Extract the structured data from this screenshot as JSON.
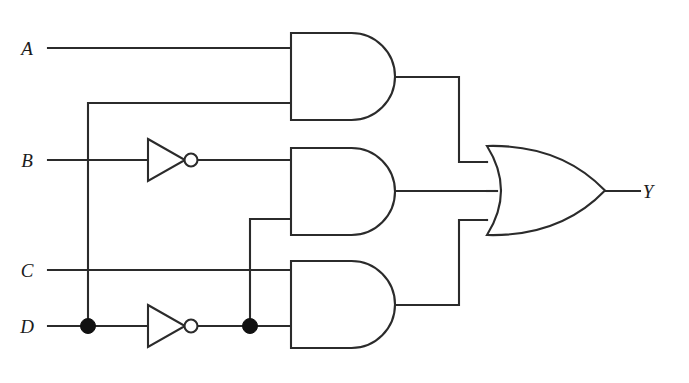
{
  "diagram": {
    "type": "logic-circuit-schematic",
    "background_color": "#ffffff",
    "line_color": "#2b2b2b",
    "junction_color": "#111111"
  },
  "inputs": [
    {
      "id": "A",
      "label": "A",
      "label_x": 27,
      "label_y": 55,
      "wire_y": 48
    },
    {
      "id": "B",
      "label": "B",
      "label_x": 27,
      "label_y": 167,
      "wire_y": 160
    },
    {
      "id": "C",
      "label": "C",
      "label_x": 27,
      "label_y": 277,
      "wire_y": 270
    },
    {
      "id": "D",
      "label": "D",
      "label_x": 27,
      "label_y": 333,
      "wire_y": 326
    }
  ],
  "outputs": [
    {
      "id": "Y",
      "label": "Y",
      "label_x": 648,
      "label_y": 198,
      "wire_y": 191
    }
  ],
  "gates": [
    {
      "id": "and1",
      "type": "AND",
      "label": "AND gate 1",
      "x": 291,
      "y": 33,
      "width": 104,
      "height": 87,
      "input_ys": [
        48,
        103
      ],
      "output_y": 77,
      "inputs": [
        "A",
        "D"
      ],
      "output_net": "n1"
    },
    {
      "id": "and2",
      "type": "AND",
      "label": "AND gate 2",
      "x": 291,
      "y": 148,
      "width": 104,
      "height": 87,
      "input_ys": [
        160,
        219
      ],
      "output_y": 191,
      "inputs": [
        "B_not",
        "D_not"
      ],
      "output_net": "n2"
    },
    {
      "id": "and3",
      "type": "AND",
      "label": "AND gate 3",
      "x": 291,
      "y": 261,
      "width": 104,
      "height": 87,
      "input_ys": [
        270,
        326
      ],
      "output_y": 305,
      "inputs": [
        "C",
        "D_not"
      ],
      "output_net": "n3"
    },
    {
      "id": "or1",
      "type": "OR",
      "label": "OR gate",
      "x": 487,
      "y": 146,
      "width": 118,
      "height": 89,
      "input_ys": [
        162,
        191,
        220
      ],
      "output_y": 191,
      "inputs": [
        "n1",
        "n2",
        "n3"
      ],
      "output_net": "Y"
    }
  ],
  "inverters": [
    {
      "id": "inv_b",
      "type": "NOT",
      "label": "Inverter on B",
      "tip_x": 148,
      "back_x": 185,
      "center_y": 160,
      "half_height": 21,
      "bubble_cx": 191,
      "bubble_r": 6.5,
      "input": "B",
      "output": "B_not"
    },
    {
      "id": "inv_d",
      "type": "NOT",
      "label": "Inverter on D",
      "tip_x": 148,
      "back_x": 185,
      "center_y": 326,
      "half_height": 21,
      "bubble_cx": 191,
      "bubble_r": 6.5,
      "input": "D",
      "output": "D_not"
    }
  ],
  "junctions": [
    {
      "id": "j_d_tap",
      "x": 88,
      "y": 326,
      "r": 7.5,
      "label": "D fan-out node"
    },
    {
      "id": "j_dnot_tap",
      "x": 250,
      "y": 326,
      "r": 7.5,
      "label": "D-inverted fan-out node"
    }
  ],
  "wires": [
    {
      "id": "w_a_in",
      "label": "A to AND1 input",
      "d": "M 48 48 L 291 48"
    },
    {
      "id": "w_b_in",
      "label": "B to inverter",
      "d": "M 48 160 L 148 160"
    },
    {
      "id": "w_c_in",
      "label": "C to AND3 input",
      "d": "M 48 270 L 291 270"
    },
    {
      "id": "w_d_in",
      "label": "D to junction",
      "d": "M 48 326 L 88 326"
    },
    {
      "id": "w_d_branch_up",
      "label": "D branch up to AND1",
      "d": "M 88 326 L 88 103 L 291 103"
    },
    {
      "id": "w_d_to_inv",
      "label": "D to inverter",
      "d": "M 88 326 L 148 326"
    },
    {
      "id": "w_bnot_out",
      "label": "B-inverted to AND2",
      "d": "M 197 160 L 291 160"
    },
    {
      "id": "w_dnot_out",
      "label": "D-inverted to junction",
      "d": "M 197 326 L 250 326"
    },
    {
      "id": "w_dnot_to_and3",
      "label": "D-inverted to AND3",
      "d": "M 250 326 L 291 326"
    },
    {
      "id": "w_dnot_branch_up",
      "label": "D-inverted branch to AND2",
      "d": "M 250 326 L 250 219 L 291 219"
    },
    {
      "id": "w_and1_out",
      "label": "AND1 output to OR top input",
      "d": "M 395 77 L 459 77 L 459 162 L 487 162"
    },
    {
      "id": "w_and2_out",
      "label": "AND2 output to OR middle input",
      "d": "M 395 191 L 497 191"
    },
    {
      "id": "w_and3_out",
      "label": "AND3 output to OR bottom input",
      "d": "M 395 305 L 459 305 L 459 220 L 487 220"
    },
    {
      "id": "w_or_out",
      "label": "OR output to Y",
      "d": "M 605 191 L 640 191"
    }
  ]
}
